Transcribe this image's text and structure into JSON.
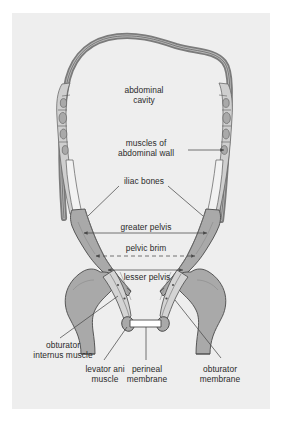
{
  "figure": {
    "kind": "anatomical-diagram",
    "panel_background": "#eeeeee",
    "page_background": "#ffffff",
    "bone_fill": "#a9a9a9",
    "muscle_fill": "#c9c9c9",
    "wall_fill": "#8a8a8a",
    "membrane_fill": "#ffffff",
    "line_color": "#4a4a4a",
    "text_color": "#2b2b2b"
  },
  "labels": {
    "abdominal_cavity": "abdominal\ncavity",
    "muscles_of_abdominal_wall": "muscles of\nabdominal wall",
    "iliac_bones": "iliac bones",
    "greater_pelvis": "greater pelvis",
    "pelvic_brim": "pelvic brim",
    "lesser_pelvis": "lesser pelvis",
    "obturator_internus_muscle": "obturator\ninternus muscle",
    "levator_ani_muscle": "levator ani\nmuscle",
    "perineal_membrane": "perineal\nmembrane",
    "obturator_membrane": "obturator\nmembrane"
  }
}
